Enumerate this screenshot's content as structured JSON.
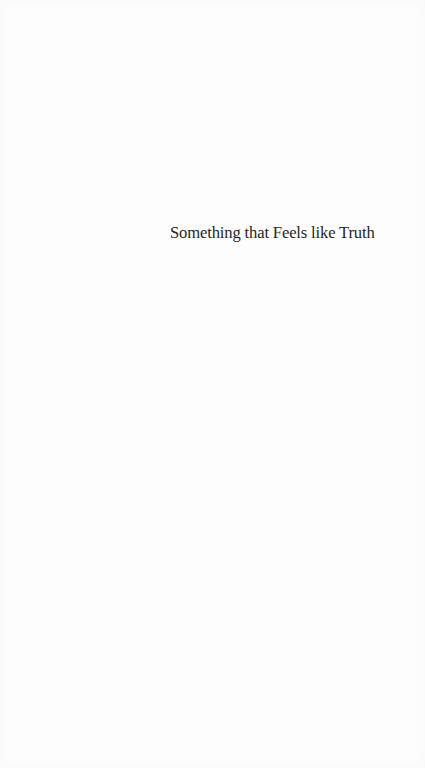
{
  "page": {
    "type": "half-title",
    "title": "Something that Feels like Truth",
    "colors": {
      "background": "#fdfdfd",
      "text": "#262626"
    }
  }
}
